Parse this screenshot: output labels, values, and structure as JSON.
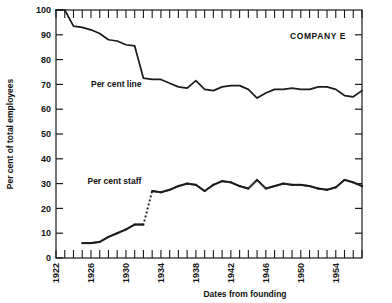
{
  "chart_data": {
    "type": "line",
    "title": "",
    "annotation_company": "COMPANY E",
    "xlabel": "Dates from founding",
    "ylabel": "Per cent of total employees",
    "xlim": [
      1922,
      1957
    ],
    "ylim": [
      0,
      100
    ],
    "grid": false,
    "legend_position": "inline-annotations",
    "x_major_ticks": [
      1922,
      1926,
      1930,
      1934,
      1938,
      1942,
      1946,
      1950,
      1954
    ],
    "x_tick_labels": [
      "1922",
      "1926",
      "1930",
      "1934",
      "1938",
      "1942",
      "1946",
      "1950",
      "1954"
    ],
    "x_minor_tick_step": 1,
    "y_ticks": [
      0,
      10,
      20,
      30,
      40,
      50,
      60,
      70,
      80,
      90,
      100
    ],
    "y_tick_labels": [
      "0",
      "10",
      "20",
      "30",
      "40",
      "50",
      "60",
      "70",
      "80",
      "90",
      "100"
    ],
    "series": [
      {
        "name": "Per cent line",
        "style": "solid",
        "color": "#1a1a1a",
        "label_x": 1926.0,
        "label_y": 70,
        "x": [
          1922,
          1923,
          1924,
          1925,
          1926,
          1927,
          1928,
          1929,
          1930,
          1931,
          1932,
          1933,
          1934,
          1935,
          1936,
          1937,
          1938,
          1939,
          1940,
          1941,
          1942,
          1943,
          1944,
          1945,
          1946,
          1947,
          1948,
          1949,
          1950,
          1951,
          1952,
          1953,
          1954,
          1955,
          1956,
          1957
        ],
        "values": [
          100,
          100,
          93.5,
          93,
          92,
          90.5,
          88,
          87.5,
          86,
          85.5,
          72.5,
          72,
          72,
          70.5,
          69,
          68.5,
          71.5,
          68,
          67.5,
          69,
          69.5,
          69.5,
          68,
          64.5,
          66.5,
          68,
          68,
          68.5,
          68,
          68,
          69,
          69,
          68,
          65.5,
          65,
          67.5
        ]
      },
      {
        "name": "Per cent staff",
        "style": "dotted",
        "color": "#1a1a1a",
        "label_x": 1925.6,
        "label_y": 31,
        "x": [
          1925,
          1926,
          1927,
          1928,
          1929,
          1930,
          1931,
          1932,
          1933,
          1934,
          1935,
          1936,
          1937,
          1938,
          1939,
          1940,
          1941,
          1942,
          1943,
          1944,
          1945,
          1946,
          1947,
          1948,
          1949,
          1950,
          1951,
          1952,
          1953,
          1954,
          1955,
          1956,
          1957
        ],
        "values": [
          6,
          6,
          6.5,
          8.5,
          10,
          11.5,
          13.5,
          13.5,
          27,
          26.5,
          27.5,
          29,
          30,
          29.5,
          27,
          29.5,
          31,
          30.5,
          29,
          28,
          31.5,
          28,
          29,
          30,
          29.5,
          29.5,
          29,
          28,
          27.5,
          28.5,
          31.5,
          30.5,
          29
        ]
      }
    ]
  }
}
